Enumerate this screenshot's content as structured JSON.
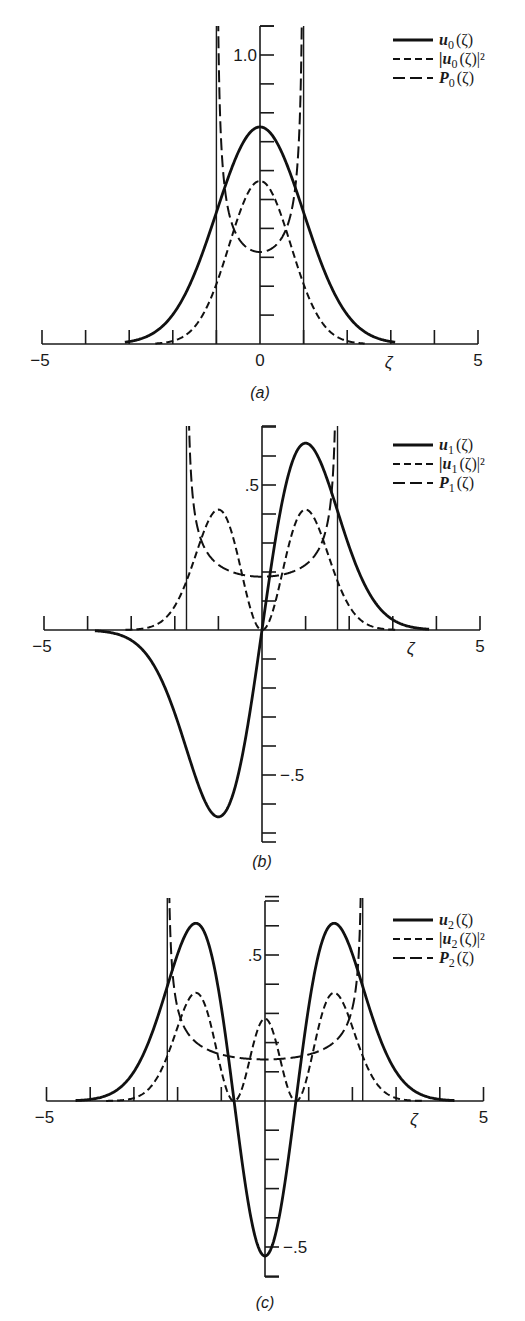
{
  "figure": {
    "panels": [
      {
        "id": "a",
        "caption": "(a)",
        "n": 0,
        "legend": [
          {
            "style": "solid",
            "label": "u",
            "sub": "0",
            "suffix": "(ζ)"
          },
          {
            "style": "short-dash",
            "label": "|u",
            "sub": "0",
            "suffix": "(ζ)|²"
          },
          {
            "style": "long-dash",
            "label": "P",
            "sub": "0",
            "suffix": "(ζ)"
          }
        ],
        "x_tick_labels": [
          {
            "x": -5,
            "text": "−5"
          },
          {
            "x": 0,
            "text": "0"
          },
          {
            "x": 5,
            "text": "5"
          }
        ],
        "x_axis_label": "ζ",
        "y_tick_labels": [
          {
            "y": 1.0,
            "text": "1.0"
          }
        ]
      },
      {
        "id": "b",
        "caption": "(b)",
        "n": 1,
        "legend": [
          {
            "style": "solid",
            "label": "u",
            "sub": "1",
            "suffix": "(ζ)"
          },
          {
            "style": "short-dash",
            "label": "|u",
            "sub": "1",
            "suffix": "(ζ)|²"
          },
          {
            "style": "long-dash",
            "label": "P",
            "sub": "1",
            "suffix": "(ζ)"
          }
        ],
        "x_tick_labels": [
          {
            "x": -5,
            "text": "−5"
          },
          {
            "x": 5,
            "text": "5"
          }
        ],
        "x_axis_label": "ζ",
        "y_tick_labels": [
          {
            "y": 0.5,
            "text": ".5"
          },
          {
            "y": -0.5,
            "text": "−.5"
          }
        ]
      },
      {
        "id": "c",
        "caption": "(c)",
        "n": 2,
        "legend": [
          {
            "style": "solid",
            "label": "u",
            "sub": "2",
            "suffix": "(ζ)"
          },
          {
            "style": "short-dash",
            "label": "|u",
            "sub": "2",
            "suffix": "(ζ)|²"
          },
          {
            "style": "long-dash",
            "label": "P",
            "sub": "2",
            "suffix": "(ζ)"
          }
        ],
        "x_tick_labels": [
          {
            "x": -5,
            "text": "−5"
          },
          {
            "x": 5,
            "text": "5"
          }
        ],
        "x_axis_label": "ζ",
        "y_tick_labels": [
          {
            "y": 0.5,
            "text": ".5"
          },
          {
            "y": -0.5,
            "text": "−.5"
          }
        ]
      }
    ]
  },
  "chart_data": [
    {
      "type": "line",
      "title": "(a)",
      "xlabel": "ζ",
      "ylabel": "",
      "xlim": [
        -5,
        5
      ],
      "ylim": [
        0,
        1.1
      ],
      "x_ticks": [
        -5,
        -4,
        -3,
        -2,
        -1,
        0,
        1,
        2,
        3,
        4,
        5
      ],
      "y_ticks": [
        0.1,
        0.2,
        0.3,
        0.4,
        0.5,
        0.6,
        0.7,
        0.8,
        0.9,
        1.0,
        1.1
      ],
      "classical_turning_points": [
        -1.0,
        1.0
      ],
      "legend_position": "upper right",
      "grid": false,
      "x": [
        -3,
        -2.5,
        -2,
        -1.5,
        -1,
        -0.5,
        0,
        0.5,
        1,
        1.5,
        2,
        2.5,
        3
      ],
      "series": [
        {
          "name": "u0(ζ)",
          "style": "solid",
          "values": [
            0.008,
            0.033,
            0.102,
            0.244,
            0.456,
            0.663,
            0.751,
            0.663,
            0.456,
            0.244,
            0.102,
            0.033,
            0.008
          ]
        },
        {
          "name": "|u0(ζ)|^2",
          "style": "short-dash",
          "values": [
            0.0001,
            0.001,
            0.01,
            0.06,
            0.208,
            0.44,
            0.564,
            0.44,
            0.208,
            0.06,
            0.01,
            0.001,
            0.0001
          ]
        },
        {
          "name": "P0(ζ)",
          "style": "long-dash",
          "note": "defined for |ζ|<1, diverges at ±1",
          "x": [
            -0.99,
            -0.9,
            -0.75,
            -0.5,
            -0.25,
            0,
            0.25,
            0.5,
            0.75,
            0.9,
            0.99
          ],
          "values": [
            2.26,
            0.73,
            0.48,
            0.37,
            0.33,
            0.318,
            0.33,
            0.37,
            0.48,
            0.73,
            2.26
          ]
        }
      ]
    },
    {
      "type": "line",
      "title": "(b)",
      "xlabel": "ζ",
      "ylabel": "",
      "xlim": [
        -5,
        5
      ],
      "ylim": [
        -0.75,
        0.8
      ],
      "x_ticks": [
        -5,
        -4,
        -3,
        -2,
        -1,
        0,
        1,
        2,
        3,
        4,
        5
      ],
      "y_ticks": [
        -0.7,
        -0.6,
        -0.5,
        -0.4,
        -0.3,
        -0.2,
        -0.1,
        0.1,
        0.2,
        0.3,
        0.4,
        0.5,
        0.6,
        0.7
      ],
      "classical_turning_points": [
        -1.732,
        1.732
      ],
      "legend_position": "upper right",
      "grid": false,
      "x": [
        -4,
        -3.5,
        -3,
        -2.5,
        -2,
        -1.5,
        -1,
        -0.5,
        0,
        0.5,
        1,
        1.5,
        2,
        2.5,
        3,
        3.5,
        4
      ],
      "series": [
        {
          "name": "u1(ζ)",
          "style": "solid",
          "values": [
            -0.002,
            -0.011,
            -0.047,
            -0.156,
            -0.407,
            -0.731,
            -0.644,
            -0.469,
            0,
            0.469,
            0.644,
            0.731,
            0.407,
            0.156,
            0.047,
            0.011,
            0.002
          ]
        },
        {
          "name": "|u1(ζ)|^2",
          "style": "short-dash",
          "values": [
            0,
            0.0001,
            0.002,
            0.024,
            0.166,
            0.534,
            0.415,
            0.22,
            0,
            0.22,
            0.415,
            0.534,
            0.166,
            0.024,
            0.002,
            0.0001,
            0
          ]
        },
        {
          "name": "P1(ζ)",
          "style": "long-dash",
          "note": "defined for |ζ|<√3, diverges at ±√3",
          "x": [
            -1.72,
            -1.6,
            -1.4,
            -1.0,
            -0.5,
            0,
            0.5,
            1.0,
            1.4,
            1.6,
            1.72
          ],
          "values": [
            1.56,
            0.48,
            0.31,
            0.225,
            0.193,
            0.184,
            0.193,
            0.225,
            0.31,
            0.48,
            1.56
          ]
        }
      ]
    },
    {
      "type": "line",
      "title": "(c)",
      "xlabel": "ζ",
      "ylabel": "",
      "xlim": [
        -5,
        5
      ],
      "ylim": [
        -0.6,
        0.8
      ],
      "x_ticks": [
        -5,
        -4,
        -3,
        -2,
        -1,
        0,
        1,
        2,
        3,
        4,
        5
      ],
      "y_ticks": [
        -0.6,
        -0.5,
        -0.4,
        -0.3,
        -0.2,
        -0.1,
        0.1,
        0.2,
        0.3,
        0.4,
        0.5,
        0.6,
        0.7
      ],
      "classical_turning_points": [
        -2.236,
        2.236
      ],
      "legend_position": "upper right",
      "grid": false,
      "x": [
        -4.5,
        -4,
        -3.5,
        -3,
        -2.5,
        -2,
        -1.5,
        -1,
        -0.707,
        -0.5,
        0,
        0.5,
        0.707,
        1,
        1.5,
        2,
        2.5,
        3,
        3.5,
        4,
        4.5
      ],
      "series": [
        {
          "name": "u2(ζ)",
          "style": "solid",
          "values": [
            0.01,
            0.034,
            0.117,
            0.289,
            0.503,
            0.609,
            0.431,
            0.161,
            0,
            -0.168,
            -0.531,
            -0.168,
            0,
            0.161,
            0.431,
            0.609,
            0.503,
            0.289,
            0.117,
            0.034,
            0.01
          ]
        },
        {
          "name": "|u2(ζ)|^2",
          "style": "short-dash",
          "values": [
            0,
            0.001,
            0.014,
            0.083,
            0.253,
            0.371,
            0.186,
            0.026,
            0,
            0.028,
            0.282,
            0.028,
            0,
            0.026,
            0.186,
            0.371,
            0.253,
            0.083,
            0.014,
            0.001,
            0
          ]
        },
        {
          "name": "P2(ζ)",
          "style": "long-dash",
          "note": "defined for |ζ|<√5, diverges at ±√5",
          "x": [
            -2.22,
            -2.0,
            -1.5,
            -1.0,
            -0.5,
            0,
            0.5,
            1.0,
            1.5,
            2.0,
            2.22
          ],
          "values": [
            1.2,
            0.318,
            0.191,
            0.159,
            0.146,
            0.142,
            0.146,
            0.159,
            0.191,
            0.318,
            1.2
          ]
        }
      ]
    }
  ]
}
